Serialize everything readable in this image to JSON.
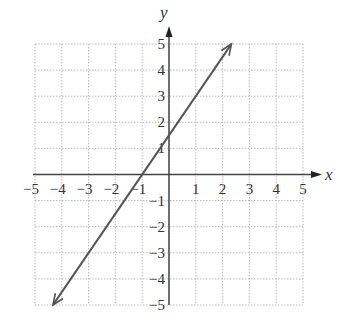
{
  "chart_data": {
    "type": "line",
    "title": "",
    "xlabel": "x",
    "ylabel": "y",
    "xlim": [
      -5,
      5
    ],
    "ylim": [
      -5,
      5
    ],
    "grid": true,
    "x_ticks": [
      "-5",
      "-4",
      "-3",
      "-2",
      "-1",
      "1",
      "2",
      "3",
      "4",
      "5"
    ],
    "y_ticks": [
      "5",
      "4",
      "3",
      "2",
      "1",
      "-1",
      "-2",
      "-3",
      "-4",
      "-5"
    ],
    "series": [
      {
        "name": "line",
        "equation": "y = 1.5x + 1.5",
        "points": [
          [
            -4.33,
            -5
          ],
          [
            -1,
            0
          ],
          [
            0,
            1.5
          ],
          [
            2.33,
            5
          ]
        ],
        "arrows_both_ends": true,
        "color": "#555555"
      }
    ]
  },
  "labels": {
    "x_axis": "x",
    "y_axis": "y"
  }
}
